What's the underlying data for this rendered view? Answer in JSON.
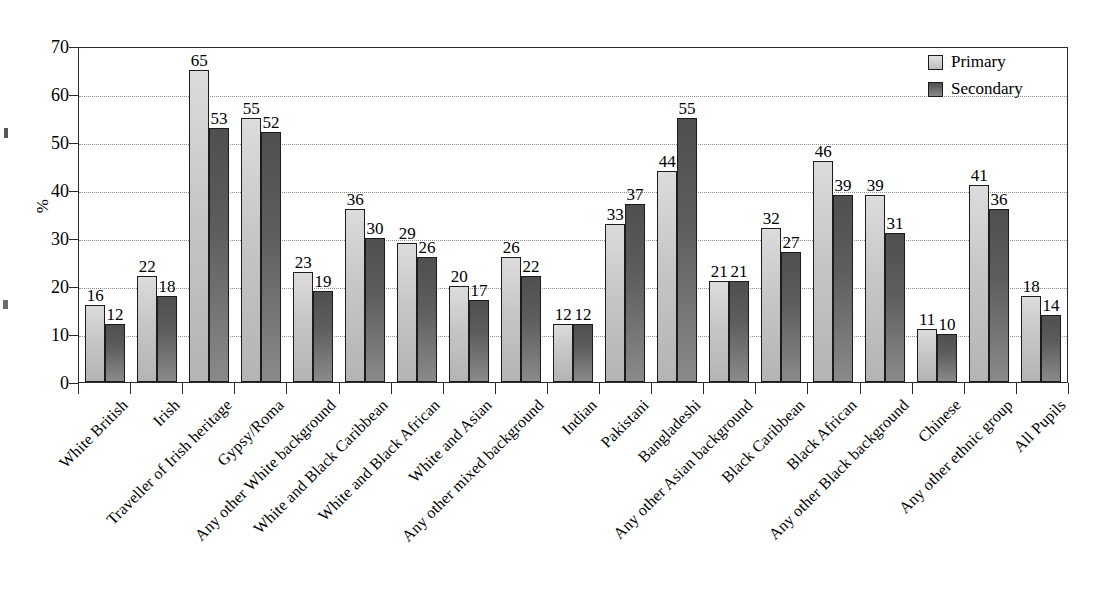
{
  "chart_data": {
    "type": "bar",
    "title": "",
    "xlabel": "",
    "ylabel": "%",
    "ylim": [
      0,
      70
    ],
    "ytick_values": [
      0,
      10,
      20,
      30,
      40,
      50,
      60,
      70
    ],
    "grid": "horizontal-dotted",
    "legend_position": "top-right",
    "categories": [
      "White British",
      "Irish",
      "Traveller of Irish heritage",
      "Gypsy/Roma",
      "Any other White background",
      "White and Black Caribbean",
      "White and Black African",
      "White and Asian",
      "Any other mixed background",
      "Indian",
      "Pakistani",
      "Bangladeshi",
      "Any other Asian background",
      "Black Caribbean",
      "Black African",
      "Any other Black background",
      "Chinese",
      "Any other ethnic group",
      "All Pupils"
    ],
    "series": [
      {
        "name": "Primary",
        "color": "#c6c6c6",
        "values": [
          16,
          22,
          65,
          55,
          23,
          36,
          29,
          20,
          26,
          12,
          33,
          44,
          21,
          32,
          46,
          39,
          11,
          41,
          18
        ]
      },
      {
        "name": "Secondary",
        "color": "#5d5d5d",
        "values": [
          12,
          18,
          53,
          52,
          19,
          30,
          26,
          17,
          22,
          12,
          37,
          55,
          21,
          27,
          39,
          31,
          10,
          36,
          14
        ]
      }
    ]
  },
  "legend": {
    "items": [
      {
        "label": "Primary"
      },
      {
        "label": "Secondary"
      }
    ]
  },
  "axis": {
    "y_title": "%"
  }
}
